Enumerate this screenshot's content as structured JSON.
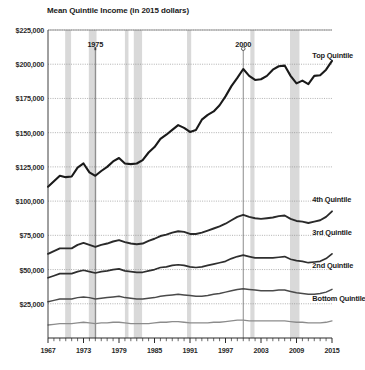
{
  "chart_data": {
    "type": "line",
    "title": "Mean Quintile Income (in 2015 dollars)",
    "xlabel": "",
    "ylabel": "",
    "xlim": [
      1967,
      2015
    ],
    "ylim": [
      0,
      225000
    ],
    "grid": true,
    "legend_position": "right-inline",
    "y_ticks": [
      0,
      25000,
      50000,
      75000,
      100000,
      125000,
      150000,
      175000,
      200000,
      225000
    ],
    "y_tick_labels": [
      "",
      "$25,000",
      "$50,000",
      "$75,000",
      "$100,000",
      "$125,000",
      "$150,000",
      "$175,000",
      "$200,000",
      "$225,000"
    ],
    "x_ticks": [
      1967,
      1973,
      1979,
      1985,
      1991,
      1997,
      2003,
      2009,
      2015
    ],
    "x_tick_labels": [
      "1967",
      "1973",
      "1979",
      "1985",
      "1991",
      "1997",
      "2003",
      "2009",
      "2015"
    ],
    "x_minor_tick_step": 1,
    "x": [
      1967,
      1968,
      1969,
      1970,
      1971,
      1972,
      1973,
      1974,
      1975,
      1976,
      1977,
      1978,
      1979,
      1980,
      1981,
      1982,
      1983,
      1984,
      1985,
      1986,
      1987,
      1988,
      1989,
      1990,
      1991,
      1992,
      1993,
      1994,
      1995,
      1996,
      1997,
      1998,
      1999,
      2000,
      2001,
      2002,
      2003,
      2004,
      2005,
      2006,
      2007,
      2008,
      2009,
      2010,
      2011,
      2012,
      2013,
      2014,
      2015
    ],
    "series": [
      {
        "name": "Top Quintile",
        "color": "#1a1a1a",
        "width": 2.1,
        "label_year": 2011,
        "label_value": 207000,
        "values": [
          110500,
          114500,
          118500,
          117500,
          118000,
          124500,
          127500,
          121000,
          118500,
          122000,
          125000,
          129000,
          131500,
          127500,
          127000,
          127500,
          130000,
          135500,
          139500,
          145500,
          148500,
          152000,
          155500,
          153500,
          150500,
          152000,
          159500,
          163000,
          165500,
          170000,
          176500,
          184000,
          190000,
          196500,
          191500,
          188500,
          189000,
          191500,
          196000,
          198500,
          199000,
          191500,
          186000,
          188000,
          185500,
          191500,
          192000,
          196000,
          202500
        ]
      },
      {
        "name": "4th Quintile",
        "color": "#2a2a2a",
        "width": 1.9,
        "label_year": 2011,
        "label_value": 101500,
        "values": [
          61500,
          63500,
          65500,
          65500,
          65500,
          68000,
          69500,
          68000,
          66500,
          68000,
          69000,
          70500,
          71500,
          70000,
          69000,
          68500,
          69000,
          71000,
          72500,
          74500,
          75500,
          77000,
          78000,
          77500,
          76000,
          76000,
          77000,
          78500,
          80000,
          81500,
          83500,
          86000,
          88500,
          90000,
          88500,
          87500,
          87000,
          87500,
          88000,
          89000,
          89500,
          87000,
          85500,
          85000,
          84000,
          85000,
          86000,
          88500,
          92500
        ]
      },
      {
        "name": "3rd Quintile",
        "color": "#2f2f2f",
        "width": 1.7,
        "label_year": 2011,
        "label_value": 77500,
        "values": [
          44000,
          45500,
          47000,
          47000,
          47000,
          48500,
          49500,
          48500,
          47500,
          48500,
          49000,
          50000,
          50500,
          49000,
          48500,
          48000,
          48000,
          49000,
          50000,
          51500,
          52000,
          53000,
          53500,
          53000,
          52000,
          51500,
          52000,
          53000,
          54000,
          55000,
          56000,
          58000,
          59500,
          60500,
          59500,
          58500,
          58500,
          58500,
          58500,
          59000,
          59500,
          57500,
          56500,
          56000,
          55000,
          55500,
          56000,
          58000,
          61500
        ]
      },
      {
        "name": "2nd Quintile",
        "color": "#4a4a4a",
        "width": 1.5,
        "label_year": 2011,
        "label_value": 53500,
        "values": [
          26500,
          27500,
          28500,
          28500,
          28500,
          29500,
          30000,
          29500,
          28500,
          29000,
          29500,
          30000,
          30500,
          29500,
          29000,
          28500,
          28500,
          29000,
          29500,
          30500,
          31000,
          31500,
          32000,
          31500,
          31000,
          30500,
          30500,
          31000,
          32000,
          32500,
          33500,
          34500,
          35500,
          36000,
          35500,
          35000,
          34500,
          34500,
          34500,
          35000,
          35000,
          34000,
          33000,
          32500,
          32000,
          32000,
          32500,
          33500,
          35500
        ]
      },
      {
        "name": "Bottom Quintile",
        "color": "#8c8c8c",
        "width": 1.3,
        "label_year": 2011,
        "label_value": 29500,
        "values": [
          9500,
          10000,
          10500,
          10500,
          10500,
          11000,
          11500,
          11000,
          10500,
          11000,
          11000,
          11500,
          11500,
          11000,
          10500,
          10500,
          10500,
          10500,
          11000,
          11500,
          11500,
          12000,
          12000,
          11500,
          11000,
          11000,
          11000,
          11000,
          11500,
          11500,
          12000,
          12500,
          13000,
          13000,
          12500,
          12500,
          12500,
          12500,
          12500,
          12500,
          12500,
          12000,
          11500,
          11500,
          11000,
          11000,
          11000,
          11500,
          12500
        ]
      }
    ],
    "recession_bands": [
      {
        "start": 1969.9,
        "end": 1970.9
      },
      {
        "start": 1973.9,
        "end": 1975.2
      },
      {
        "start": 1980.0,
        "end": 1980.6
      },
      {
        "start": 1981.5,
        "end": 1982.9
      },
      {
        "start": 1990.5,
        "end": 1991.2
      },
      {
        "start": 2001.2,
        "end": 2001.9
      },
      {
        "start": 2007.9,
        "end": 2009.5
      }
    ],
    "recession_band_color": "#d9d9d9",
    "annotations": [
      {
        "label": "1975",
        "year": 1975,
        "marker": "tick",
        "text_value": 215000
      },
      {
        "label": "2000",
        "year": 2000,
        "marker": "circle",
        "text_value": 215000
      }
    ]
  }
}
